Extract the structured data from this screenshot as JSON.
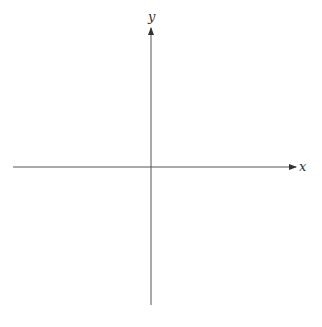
{
  "diagram": {
    "type": "coordinate-axes",
    "x_axis": {
      "label": "x",
      "color": "#444444"
    },
    "y_axis": {
      "label": "y",
      "color": "#444444"
    }
  }
}
